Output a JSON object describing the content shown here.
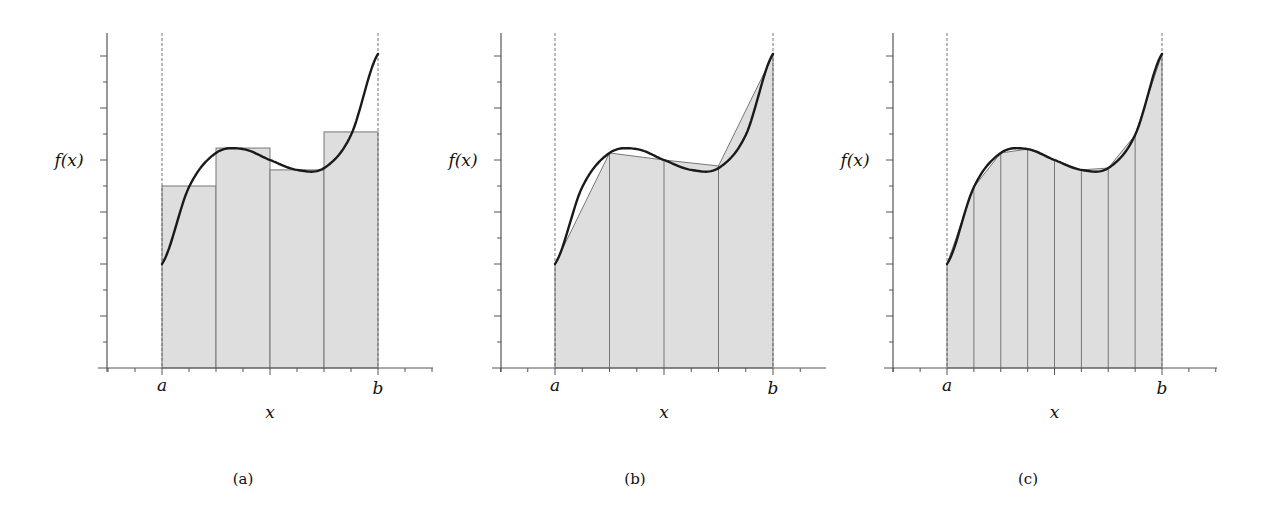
{
  "figure": {
    "colors": {
      "fill": "#dedede",
      "curve": "#1a1a1a",
      "axis": "#555555"
    },
    "y_label": "f(x)",
    "x_label": "x",
    "a_label": "a",
    "b_label": "b"
  },
  "chart_data": [
    {
      "type": "area",
      "title": "(a)",
      "method": "midpoint rectangles",
      "xlabel": "x",
      "ylabel": "f(x)",
      "x_ticks": [
        "a",
        "b"
      ],
      "intervals": 4,
      "curve_samples": {
        "t": [
          0,
          0.125,
          0.25,
          0.375,
          0.5,
          0.625,
          0.75,
          0.875,
          1
        ],
        "f": [
          4.0,
          6.96,
          8.27,
          8.42,
          8.0,
          7.62,
          7.69,
          8.96,
          12.08
        ]
      },
      "rect_heights": [
        7.0,
        8.46,
        7.62,
        9.08
      ],
      "ylim": [
        0,
        13
      ],
      "grid": false
    },
    {
      "type": "area",
      "title": "(b)",
      "method": "trapezoids",
      "xlabel": "x",
      "ylabel": "f(x)",
      "x_ticks": [
        "a",
        "b"
      ],
      "intervals": 4,
      "node_values": [
        4.0,
        8.27,
        8.0,
        7.77,
        12.04
      ],
      "ylim": [
        0,
        13
      ],
      "grid": false
    },
    {
      "type": "area",
      "title": "(c)",
      "method": "trapezoids (fine)",
      "xlabel": "x",
      "ylabel": "f(x)",
      "x_ticks": [
        "a",
        "b"
      ],
      "intervals": 8,
      "node_values": [
        4.0,
        6.96,
        8.27,
        8.42,
        8.0,
        7.62,
        7.69,
        8.96,
        12.08
      ],
      "ylim": [
        0,
        13
      ],
      "grid": false
    }
  ],
  "panels": [
    {
      "caption": "(a)",
      "yaxis_x": 107,
      "a_x": 162,
      "b_x": 378,
      "axis_left": 98,
      "axis_right": 433,
      "caption_x": 243,
      "ylabel_x": 69
    },
    {
      "caption": "(b)",
      "yaxis_x": 501,
      "a_x": 555,
      "b_x": 773,
      "axis_left": 492,
      "axis_right": 826,
      "caption_x": 635,
      "ylabel_x": 463
    },
    {
      "caption": "(c)",
      "yaxis_x": 893,
      "a_x": 947,
      "b_x": 1162,
      "axis_left": 884,
      "axis_right": 1217,
      "caption_x": 1028,
      "ylabel_x": 855
    }
  ],
  "layout": {
    "axis_y": 368,
    "unit_px": 26,
    "top_y": 33,
    "caption_y": 484,
    "ab_label_y": 391,
    "x_label_y": 418
  }
}
